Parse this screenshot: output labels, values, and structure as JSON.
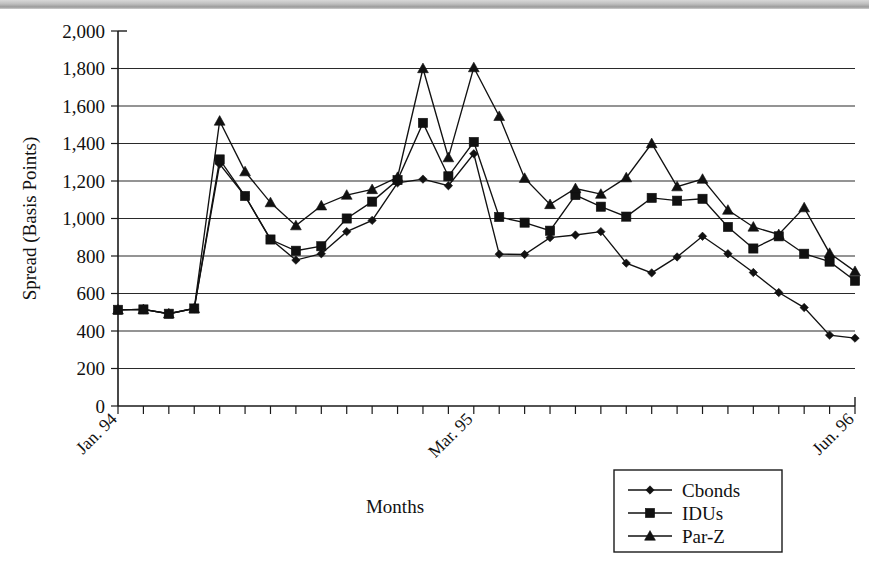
{
  "figure": {
    "background": "#ffffff",
    "ink_color": "#111111",
    "scan_strip_present": true
  },
  "chart_data": {
    "type": "line",
    "title": "",
    "xlabel": "Months",
    "ylabel": "Spread (Basis Points)",
    "ylim": [
      0,
      2000
    ],
    "ytick_values": [
      0,
      200,
      400,
      600,
      800,
      1000,
      1200,
      1400,
      1600,
      1800,
      2000
    ],
    "ytick_labels": [
      "0",
      "200",
      "400",
      "600",
      "800",
      "1,000",
      "1,200",
      "1,400",
      "1,600",
      "1,800",
      "2,000"
    ],
    "grid": "horizontal",
    "legend_position": "bottom-right",
    "x_count": 30,
    "x_axis_note": "monthly ticks, unlabeled except anchors",
    "xtick_labels": [
      {
        "index": 0,
        "label": "Jan. 94"
      },
      {
        "index": 14,
        "label": "Mar. 95"
      },
      {
        "index": 29,
        "label": "Jun. 96"
      }
    ],
    "series": [
      {
        "name": "Cbonds",
        "marker": "diamond",
        "values": [
          513,
          515,
          492,
          520,
          1290,
          1120,
          890,
          778,
          812,
          930,
          990,
          1190,
          1210,
          1175,
          1345,
          810,
          808,
          898,
          912,
          930,
          762,
          710,
          795,
          905,
          812,
          712,
          605,
          525,
          378,
          362
        ]
      },
      {
        "name": "IDUs",
        "marker": "square",
        "values": [
          513,
          515,
          492,
          520,
          1315,
          1120,
          888,
          828,
          852,
          1000,
          1090,
          1205,
          1510,
          1225,
          1408,
          1008,
          978,
          935,
          1125,
          1063,
          1010,
          1110,
          1095,
          1105,
          955,
          840,
          905,
          812,
          770,
          668
        ]
      },
      {
        "name": "Par-Z",
        "marker": "triangle",
        "values": [
          513,
          515,
          492,
          520,
          1520,
          1250,
          1085,
          962,
          1068,
          1125,
          1155,
          1220,
          1800,
          1325,
          1805,
          1545,
          1215,
          1075,
          1160,
          1130,
          1218,
          1400,
          1170,
          1210,
          1045,
          955,
          915,
          1058,
          815,
          718
        ]
      }
    ]
  }
}
